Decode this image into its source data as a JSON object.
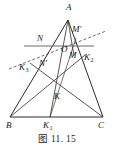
{
  "figure": {
    "caption": "图 11. 15",
    "type": "euclidean-geometry-triangle-diagram",
    "colors": {
      "stroke": "#2b2b2b",
      "light_stroke": "#6b6b6b",
      "label": "#1a1a1a",
      "background": "#ffffff"
    },
    "points": [
      {
        "id": "A",
        "label": "A",
        "sub": "",
        "x": 68,
        "y": 20,
        "label_x": 66,
        "label_y": 10
      },
      {
        "id": "B",
        "label": "B",
        "sub": "",
        "x": 10,
        "y": 117,
        "label_x": 6,
        "label_y": 128
      },
      {
        "id": "C",
        "label": "C",
        "sub": "",
        "x": 103,
        "y": 117,
        "label_x": 99,
        "label_y": 128
      },
      {
        "id": "N",
        "label": "N",
        "sub": "",
        "x": 48,
        "y": 46,
        "label_x": 38,
        "label_y": 41
      },
      {
        "id": "Np",
        "label": "N′",
        "sub": "",
        "x": 47,
        "y": 60,
        "label_x": 40,
        "label_y": 66
      },
      {
        "id": "Mp",
        "label": "M′",
        "sub": "",
        "x": 76,
        "y": 38,
        "label_x": 74,
        "label_y": 32
      },
      {
        "id": "M",
        "label": "M",
        "sub": "",
        "x": 74,
        "y": 55,
        "label_x": 71,
        "label_y": 59
      },
      {
        "id": "O",
        "label": "O",
        "sub": "",
        "x": 66,
        "y": 50,
        "label_x": 62,
        "label_y": 52
      },
      {
        "id": "K",
        "label": "K",
        "sub": "",
        "x": 55,
        "y": 88,
        "label_x": 55,
        "label_y": 99
      },
      {
        "id": "K1",
        "label": "K",
        "sub": "1",
        "x": 50,
        "y": 117,
        "label_x": 44,
        "label_y": 128
      },
      {
        "id": "K2",
        "label": "K",
        "sub": "2",
        "x": 85,
        "y": 55,
        "label_x": 85,
        "label_y": 60
      },
      {
        "id": "K3",
        "label": "K",
        "sub": "3",
        "x": 30,
        "y": 63,
        "label_x": 20,
        "label_y": 70
      }
    ],
    "segments": [
      {
        "name": "side-AB",
        "from": "A",
        "to": "B",
        "style": "solid",
        "weight": 1.0
      },
      {
        "name": "side-AC",
        "from": "A",
        "to": "C",
        "style": "solid",
        "weight": 1.0
      },
      {
        "name": "side-BC",
        "from": "B",
        "to": "C",
        "style": "solid",
        "weight": 1.0
      },
      {
        "name": "cevian-A-K1",
        "from": "A",
        "to": "K1",
        "style": "solid",
        "weight": 0.9
      },
      {
        "name": "cevian-B-K2",
        "from": "B",
        "to": "K2",
        "style": "solid",
        "weight": 0.9
      },
      {
        "name": "cevian-C-K3",
        "from": "C",
        "to": "K3",
        "style": "solid",
        "weight": 0.9
      },
      {
        "name": "segment-A-M",
        "from": "A",
        "to": "M",
        "style": "solid",
        "weight": 0.9
      },
      {
        "name": "segment-Mp-K1",
        "from": "Mp",
        "to": "K1",
        "style": "solid",
        "weight": 0.9
      }
    ],
    "lines": [
      {
        "name": "horizontal-line-N-K2",
        "x1": 24,
        "y1": 46,
        "x2": 94,
        "y2": 46,
        "style": "solid",
        "weight": 1.0
      },
      {
        "name": "dashed-line-K3-Mp",
        "x1": 9,
        "y1": 69,
        "x2": 106,
        "y2": 31,
        "style": "dashed",
        "weight": 0.9
      }
    ]
  }
}
